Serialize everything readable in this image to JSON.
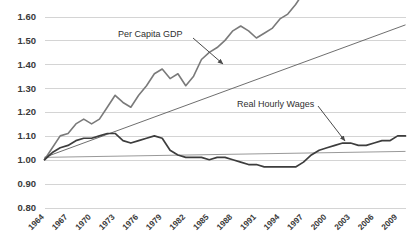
{
  "chart_data": {
    "type": "line",
    "title": "",
    "xlabel": "",
    "ylabel": "",
    "grid": true,
    "legend_position": "inline-annotations",
    "ylim": [
      0.8,
      1.6
    ],
    "xlim": [
      1964,
      2010
    ],
    "yticks": [
      "0.80",
      "0.90",
      "1.00",
      "1.10",
      "1.20",
      "1.30",
      "1.40",
      "1.50",
      "1.60"
    ],
    "ytick_values": [
      0.8,
      0.9,
      1.0,
      1.1,
      1.2,
      1.3,
      1.4,
      1.5,
      1.6
    ],
    "xticks": [
      "1964",
      "1967",
      "1970",
      "1973",
      "1976",
      "1979",
      "1982",
      "1985",
      "1988",
      "1991",
      "1994",
      "1997",
      "2000",
      "2003",
      "2006",
      "2009"
    ],
    "xtick_values": [
      1964,
      1967,
      1970,
      1973,
      1976,
      1979,
      1982,
      1985,
      1988,
      1991,
      1994,
      1997,
      2000,
      2003,
      2006,
      2009
    ],
    "x": [
      1964,
      1965,
      1966,
      1967,
      1968,
      1969,
      1970,
      1971,
      1972,
      1973,
      1974,
      1975,
      1976,
      1977,
      1978,
      1979,
      1980,
      1981,
      1982,
      1983,
      1984,
      1985,
      1986,
      1987,
      1988,
      1989,
      1990,
      1991,
      1992,
      1993,
      1994,
      1995,
      1996,
      1997,
      1998,
      1999,
      2000,
      2001,
      2002,
      2003,
      2004,
      2005,
      2006,
      2007,
      2008,
      2009,
      2010
    ],
    "series": [
      {
        "name": "Per Capita GDP",
        "color": "#7a7a7a",
        "width": 1.6,
        "values": [
          1.0,
          1.05,
          1.1,
          1.11,
          1.15,
          1.17,
          1.15,
          1.17,
          1.22,
          1.27,
          1.24,
          1.22,
          1.27,
          1.31,
          1.36,
          1.38,
          1.34,
          1.36,
          1.31,
          1.35,
          1.42,
          1.45,
          1.47,
          1.5,
          1.54,
          1.56,
          1.54,
          1.51,
          1.53,
          1.55,
          1.59,
          1.61,
          1.65,
          1.7,
          1.75,
          1.8,
          1.84,
          1.82,
          1.83,
          1.85,
          1.9,
          1.93,
          1.95,
          1.95,
          1.91,
          1.85,
          1.88
        ]
      },
      {
        "name": "Real Hourly Wages",
        "color": "#3d3d3d",
        "width": 1.7,
        "values": [
          1.0,
          1.03,
          1.05,
          1.06,
          1.08,
          1.09,
          1.09,
          1.1,
          1.11,
          1.11,
          1.08,
          1.07,
          1.08,
          1.09,
          1.1,
          1.09,
          1.04,
          1.02,
          1.01,
          1.01,
          1.01,
          1.0,
          1.01,
          1.01,
          1.0,
          0.99,
          0.98,
          0.98,
          0.97,
          0.97,
          0.97,
          0.97,
          0.97,
          0.99,
          1.02,
          1.04,
          1.05,
          1.06,
          1.07,
          1.07,
          1.06,
          1.06,
          1.07,
          1.08,
          1.08,
          1.1,
          1.1
        ]
      }
    ],
    "trendlines": [
      {
        "name": "gdp-trendline",
        "color": "#5e5e5e",
        "width": 0.9,
        "x0": 1964,
        "y0": 1.01,
        "x1": 2010,
        "y1": 1.565
      },
      {
        "name": "wages-trendline",
        "color": "#8d8d8d",
        "width": 0.9,
        "x0": 1964,
        "y0": 1.01,
        "x1": 2010,
        "y1": 1.035
      }
    ],
    "annotations": [
      {
        "name": "per-capita-gdp-annotation",
        "text": "Per Capita GDP",
        "label_x": 118,
        "label_y": 37,
        "arrow_x1": 193,
        "arrow_y1": 38,
        "arrow_x2": 223,
        "arrow_y2": 64
      },
      {
        "name": "real-hourly-wages-annotation",
        "text": "Real Hourly Wages",
        "label_x": 237,
        "label_y": 107,
        "arrow_x1": 318,
        "arrow_y1": 106,
        "arrow_x2": 345,
        "arrow_y2": 141
      }
    ]
  },
  "colors": {
    "background": "#ffffff",
    "grid": "#d4d4d4",
    "gdp_series": "#7a7a7a",
    "wages_series": "#3d3d3d",
    "tick_text": "#3a3a3a",
    "annotation_text": "#2f2f2f"
  }
}
